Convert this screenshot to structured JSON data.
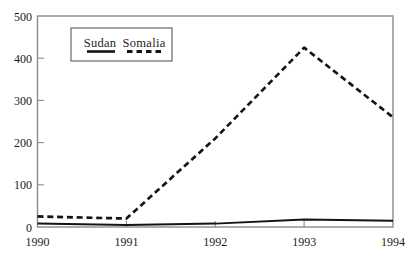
{
  "figure": {
    "background": "#ffffff"
  },
  "colors": {
    "line": "#141414",
    "frame": "#8c8c8c",
    "text": "#1b1b1b",
    "background": "#ffffff"
  },
  "chart_data": {
    "type": "line",
    "title": "",
    "xlabel": "",
    "ylabel": "",
    "x": [
      1990,
      1991,
      1992,
      1993,
      1994
    ],
    "x_tick_labels": [
      "1990",
      "1991",
      "1992",
      "1993",
      "1994"
    ],
    "ylim": [
      0,
      500
    ],
    "yticks": [
      0,
      100,
      200,
      300,
      400,
      500
    ],
    "grid": false,
    "legend_position": "top-left-inside",
    "series": [
      {
        "name": "Sudan",
        "line_style": "solid",
        "values": [
          8,
          5,
          8,
          18,
          15
        ]
      },
      {
        "name": "Somalia",
        "line_style": "dashed",
        "values": [
          25,
          20,
          210,
          425,
          260
        ]
      }
    ]
  }
}
